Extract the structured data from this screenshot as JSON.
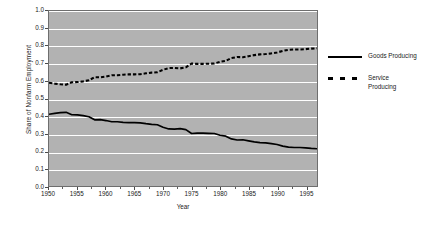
{
  "chart_data": {
    "type": "line",
    "title": "",
    "xlabel": "Year",
    "ylabel": "Share of Nonfarm Employment",
    "xlim": [
      1950,
      1997
    ],
    "ylim": [
      0.0,
      1.0
    ],
    "grid": true,
    "legend_position": "right",
    "x_ticks": [
      1950,
      1955,
      1960,
      1965,
      1970,
      1975,
      1980,
      1985,
      1990,
      1995
    ],
    "x_tick_labels": [
      "1950",
      "1955",
      "1960",
      "1965",
      "1970",
      "1975",
      "1980",
      "1985",
      "1990",
      "1995"
    ],
    "y_ticks": [
      0.0,
      0.1,
      0.2,
      0.3,
      0.4,
      0.5,
      0.6,
      0.7,
      0.8,
      0.9,
      1.0
    ],
    "y_tick_labels": [
      "0.0",
      "0.1",
      "0.2",
      "0.3",
      "0.4",
      "0.5",
      "0.6",
      "0.7",
      "0.8",
      "0.9",
      "1.0"
    ],
    "x": [
      1950,
      1951,
      1952,
      1953,
      1954,
      1955,
      1956,
      1957,
      1958,
      1959,
      1960,
      1961,
      1962,
      1963,
      1964,
      1965,
      1966,
      1967,
      1968,
      1969,
      1970,
      1971,
      1972,
      1973,
      1974,
      1975,
      1976,
      1977,
      1978,
      1979,
      1980,
      1981,
      1982,
      1983,
      1984,
      1985,
      1986,
      1987,
      1988,
      1989,
      1990,
      1991,
      1992,
      1993,
      1994,
      1995,
      1996,
      1997
    ],
    "series": [
      {
        "name": "Goods Producing",
        "style": "solid",
        "color": "#000000",
        "values": [
          0.41,
          0.415,
          0.419,
          0.421,
          0.407,
          0.406,
          0.402,
          0.396,
          0.378,
          0.379,
          0.374,
          0.367,
          0.367,
          0.364,
          0.362,
          0.362,
          0.361,
          0.356,
          0.352,
          0.35,
          0.336,
          0.326,
          0.325,
          0.328,
          0.322,
          0.3,
          0.302,
          0.302,
          0.301,
          0.3,
          0.29,
          0.285,
          0.269,
          0.263,
          0.264,
          0.258,
          0.252,
          0.248,
          0.246,
          0.242,
          0.237,
          0.228,
          0.222,
          0.22,
          0.22,
          0.218,
          0.215,
          0.213
        ]
      },
      {
        "name": "Service Producing",
        "style": "dashed",
        "color": "#000000",
        "values": [
          0.59,
          0.585,
          0.581,
          0.579,
          0.593,
          0.594,
          0.598,
          0.604,
          0.622,
          0.621,
          0.626,
          0.633,
          0.633,
          0.636,
          0.638,
          0.638,
          0.639,
          0.644,
          0.648,
          0.65,
          0.664,
          0.674,
          0.675,
          0.672,
          0.678,
          0.7,
          0.698,
          0.698,
          0.699,
          0.7,
          0.71,
          0.715,
          0.731,
          0.737,
          0.736,
          0.742,
          0.748,
          0.752,
          0.754,
          0.758,
          0.763,
          0.772,
          0.778,
          0.78,
          0.78,
          0.782,
          0.785,
          0.787
        ]
      }
    ]
  },
  "legend": {
    "items": [
      {
        "label": "Goods Producing",
        "style": "solid"
      },
      {
        "label": "Service\nProducing",
        "style": "dashed"
      }
    ]
  }
}
